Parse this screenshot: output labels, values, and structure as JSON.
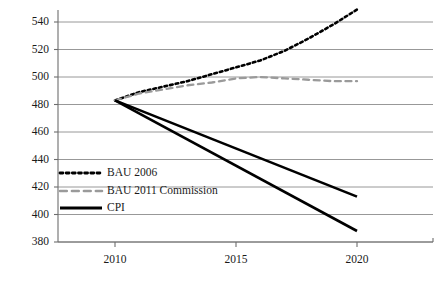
{
  "chart_data": {
    "type": "line",
    "title": "",
    "subtitle": "",
    "xlabel": "",
    "ylabel": "",
    "xlim": [
      2009.0,
      2022.1
    ],
    "ylim": [
      380,
      550
    ],
    "grid": true,
    "grid_axis": "y",
    "legend_position": "inside-left-lower",
    "x_ticks": [
      {
        "value": 2010,
        "label": "2010"
      },
      {
        "value": 2015,
        "label": "2015"
      },
      {
        "value": 2020,
        "label": "2020"
      }
    ],
    "y_ticks": [
      {
        "value": 380,
        "label": "380"
      },
      {
        "value": 400,
        "label": "400"
      },
      {
        "value": 420,
        "label": "420"
      },
      {
        "value": 440,
        "label": "440"
      },
      {
        "value": 460,
        "label": "460"
      },
      {
        "value": 480,
        "label": "480"
      },
      {
        "value": 500,
        "label": "500"
      },
      {
        "value": 520,
        "label": "520"
      },
      {
        "value": 540,
        "label": "540"
      }
    ],
    "series": [
      {
        "name": "BAU 2006",
        "style": "dotted",
        "color": "#000000",
        "x": [
          2010,
          2011,
          2012,
          2013,
          2014,
          2015,
          2016,
          2017,
          2018,
          2019,
          2020
        ],
        "values": [
          483,
          489,
          493,
          497,
          502,
          507,
          512,
          519,
          528,
          538,
          549
        ]
      },
      {
        "name": "BAU 2011 Commission",
        "style": "dashed",
        "color": "#9a9a9a",
        "x": [
          2010,
          2011,
          2012,
          2013,
          2014,
          2015,
          2016,
          2017,
          2018,
          2019,
          2020
        ],
        "values": [
          483,
          488,
          491,
          494,
          496,
          499,
          500,
          499,
          498,
          497,
          497
        ]
      },
      {
        "name": "CPI",
        "style": "solid",
        "color": "#000000",
        "x": [
          2010,
          2020
        ],
        "values": [
          483,
          413
        ]
      },
      {
        "name": "CPI",
        "style": "solid",
        "color": "#000000",
        "x": [
          2010,
          2020
        ],
        "values": [
          483,
          388
        ]
      }
    ],
    "legend_entries": [
      {
        "label": "BAU 2006",
        "style": "dotted",
        "color": "#000000"
      },
      {
        "label": "BAU 2011 Commission",
        "style": "dashed",
        "color": "#9a9a9a"
      },
      {
        "label": "CPI",
        "style": "solid",
        "color": "#000000"
      }
    ],
    "colors": {
      "axis": "#6d6d6d",
      "grid": "#8c8c8c",
      "text": "#1a1a1a",
      "background": "#ffffff"
    }
  }
}
